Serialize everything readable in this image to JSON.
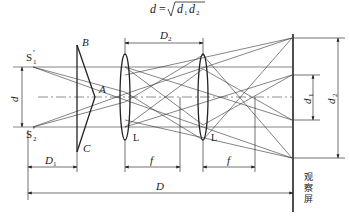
{
  "formula": {
    "lhs": "d",
    "eq": "=",
    "radicand_d1": "d",
    "radicand_d1_sub": "1",
    "radicand_d2": "d",
    "radicand_d2_sub": "2"
  },
  "labels": {
    "source1": "S",
    "source1_sub": "1",
    "source1_prime": "′",
    "source2": "S",
    "source2_sub": "2",
    "source2_prime": "′",
    "prism_top": "B",
    "prism_apex": "A",
    "prism_bottom": "C",
    "lens1": "L",
    "lens2": "L",
    "sep_d": "d",
    "d1": "d",
    "d1_sub": "1",
    "d2": "d",
    "d2_sub": "2",
    "D1": "D",
    "D1_sub": "1",
    "D2": "D",
    "D2_sub": "2",
    "f1": "f",
    "f2": "f",
    "D": "D",
    "screen": [
      "观",
      "察",
      "屏"
    ]
  },
  "colors": {
    "line": "#222222",
    "background": "#ffffff"
  }
}
